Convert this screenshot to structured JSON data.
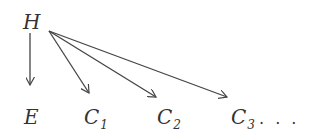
{
  "diagram": {
    "nodes": [
      {
        "id": "H",
        "label": "H",
        "sub": ""
      },
      {
        "id": "E",
        "label": "E",
        "sub": ""
      },
      {
        "id": "C1",
        "label": "C",
        "sub": "1"
      },
      {
        "id": "C2",
        "label": "C",
        "sub": "2"
      },
      {
        "id": "C3",
        "label": "C",
        "sub": "3",
        "suffix": ". . ."
      }
    ],
    "edges": [
      {
        "from": "H",
        "to": "E"
      },
      {
        "from": "H",
        "to": "C1"
      },
      {
        "from": "H",
        "to": "C2"
      },
      {
        "from": "H",
        "to": "C3"
      }
    ],
    "stroke_color": "#444444"
  }
}
